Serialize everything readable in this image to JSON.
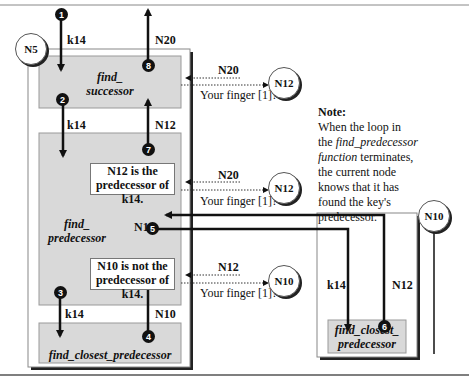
{
  "nodes": {
    "n5": "N5",
    "n12_top": "N12",
    "n12_mid": "N12",
    "n10_small": "N10",
    "n10_right": "N10"
  },
  "functions": {
    "find_successor_1": "find_",
    "find_successor_2": "successor",
    "find_predecessor_1": "find_",
    "find_predecessor_2": "predecessor",
    "find_closest_predecessor": "find_closest_predecessor",
    "remote_closest_1": "find_closest_",
    "remote_closest_2": "predecessor"
  },
  "steps": [
    "1",
    "2",
    "3",
    "4",
    "5",
    "6",
    "7",
    "8"
  ],
  "labels": {
    "k14_top": "k14",
    "n20_top": "N20",
    "k14_mid": "k14",
    "n12_mid": "N12",
    "k14_low": "k14",
    "n10_low": "N10",
    "n12_inner": "N12",
    "k14_right": "k14",
    "n12_right": "N12"
  },
  "messages": {
    "query1_reply": "N20",
    "query1_question": "Your finger [1]?",
    "query2_reply": "N20",
    "query2_question": "Your finger [1]?",
    "query3_reply": "N12",
    "query3_question": "Your finger [1]?"
  },
  "result_boxes": {
    "is_pred_1": "N12 is the",
    "is_pred_2": "predecessor of k14.",
    "not_pred_1": "N10 is not the",
    "not_pred_2": "predecessor of k14."
  },
  "note": {
    "title": "Note:",
    "line1": "When the loop in",
    "line2_pre": "the ",
    "line2_ital": "find_predecessor",
    "line3_ital": "function",
    "line3_post": " terminates,",
    "line4": "the current node",
    "line5": "knows that it has",
    "line6": "found the key's",
    "line7": "predecessor."
  },
  "colors": {
    "box_fill": "#d9d9d9",
    "line": "#111111",
    "frame": "#888888"
  }
}
